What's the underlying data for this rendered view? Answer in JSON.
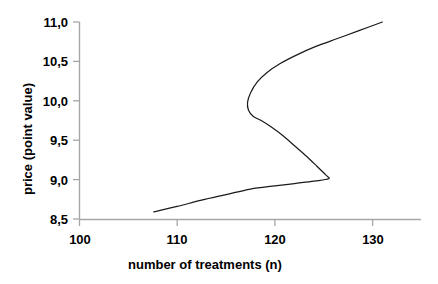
{
  "chart_data": {
    "type": "line",
    "title": "",
    "subtitle": "",
    "xlabel": "number of treatments (n)",
    "ylabel": "price (point value)",
    "xlim": [
      100,
      134.5
    ],
    "ylim": [
      8.5,
      11.0
    ],
    "xticks": [
      "100",
      "110",
      "120",
      "130"
    ],
    "xtick_values": [
      100,
      110,
      120,
      130
    ],
    "yticks": [
      "8,5",
      "9,0",
      "9,5",
      "10,0",
      "10,5",
      "11,0"
    ],
    "ytick_values": [
      8.5,
      9.0,
      9.5,
      10.0,
      10.5,
      11.0
    ],
    "grid": false,
    "legend": null,
    "decimal_separator": ",",
    "series": [
      {
        "name": "backward-bending supply curve",
        "color": "#1a1a1a",
        "line_width": 1.2,
        "points": [
          [
            107.6,
            8.59
          ],
          [
            110.0,
            8.66
          ],
          [
            112.5,
            8.74
          ],
          [
            115.0,
            8.81
          ],
          [
            117.5,
            8.88
          ],
          [
            120.0,
            8.92
          ],
          [
            122.0,
            8.95
          ],
          [
            124.0,
            8.98
          ],
          [
            125.5,
            9.01
          ],
          [
            125.2,
            9.06
          ],
          [
            124.3,
            9.17
          ],
          [
            123.2,
            9.3
          ],
          [
            122.0,
            9.43
          ],
          [
            120.8,
            9.56
          ],
          [
            119.6,
            9.67
          ],
          [
            118.6,
            9.75
          ],
          [
            117.8,
            9.8
          ],
          [
            117.3,
            9.88
          ],
          [
            117.2,
            9.98
          ],
          [
            117.5,
            10.1
          ],
          [
            118.2,
            10.24
          ],
          [
            119.2,
            10.36
          ],
          [
            120.5,
            10.47
          ],
          [
            122.2,
            10.58
          ],
          [
            124.2,
            10.69
          ],
          [
            126.4,
            10.79
          ],
          [
            128.6,
            10.89
          ],
          [
            131.0,
            11.0
          ]
        ]
      }
    ],
    "annotations": [],
    "axis_color": "#a6a6a6",
    "text_color": "#000000",
    "background_color": "#ffffff"
  },
  "axes": {
    "x_title": "number of treatments (n)",
    "y_title": "price (point value)",
    "x_labels": [
      "100",
      "110",
      "120",
      "130"
    ],
    "y_labels": [
      "11,0",
      "10,5",
      "10,0",
      "9,5",
      "9,0",
      "8,5"
    ]
  }
}
